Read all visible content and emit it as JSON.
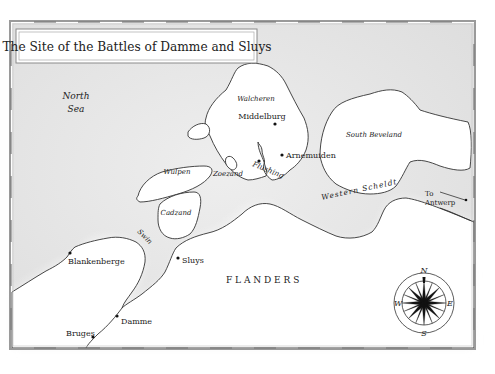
{
  "map": {
    "title": "The Site of the Battles of Damme and Sluys",
    "colors": {
      "sea": "#e3e3e3",
      "land": "#ffffff",
      "frame": "#9a9a9a",
      "coastline": "#333333",
      "text": "#222222"
    },
    "water_labels": {
      "north_sea_line1": "North",
      "north_sea_line2": "Sea",
      "swin": "Swin",
      "western_scheldt": "Western Scheldt"
    },
    "island_labels": {
      "walcheren": "Walcheren",
      "south_beveland": "South Beveland",
      "wulpen": "Wulpen",
      "cadzand": "Cadzand",
      "zoezand": "Zoezand"
    },
    "region_labels": {
      "flanders": "F L A N D E R S"
    },
    "towns": [
      {
        "name": "Middelburg"
      },
      {
        "name": "Arnemuiden"
      },
      {
        "name": "Flushing"
      },
      {
        "name": "Blankenberge"
      },
      {
        "name": "Sluys"
      },
      {
        "name": "Damme"
      },
      {
        "name": "Bruges"
      }
    ],
    "direction_note": {
      "line1": "To",
      "line2": "Antwerp"
    },
    "compass": {
      "north": "N",
      "south": "S",
      "east": "E",
      "west": "W"
    }
  }
}
